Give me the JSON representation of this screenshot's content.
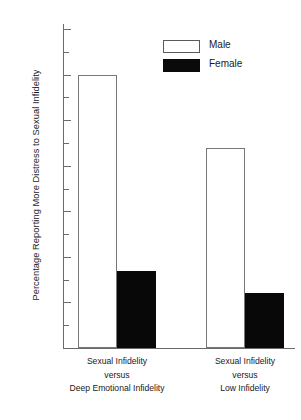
{
  "chart_data": {
    "type": "bar",
    "title": "",
    "xlabel": "",
    "ylabel": "Percentage Reporting More Distress to Sexual Infidelity",
    "ylim": [
      0,
      70
    ],
    "ytick_step_major": 10,
    "ytick_step_minor": 5,
    "grid": false,
    "legend_position": "top-center",
    "categories": [
      "Sexual Infidelity versus Deep Emotional Infidelity",
      "Sexual Infidelity versus Low Infidelity"
    ],
    "category_lines": [
      [
        "Sexual Infidelity",
        "versus",
        "Deep Emotional Infidelity"
      ],
      [
        "Sexual Infidelity",
        "versus",
        "Low Infidelity"
      ]
    ],
    "series": [
      {
        "name": "Male",
        "values": [
          60,
          44
        ],
        "color": "#ffffff",
        "edge_color": "#777777"
      },
      {
        "name": "Female",
        "values": [
          17,
          12
        ],
        "color": "#080808",
        "edge_color": "#080808"
      }
    ],
    "ytick_labels": [
      "0",
      "10",
      "20",
      "30",
      "40",
      "50",
      "60",
      "70"
    ],
    "ytick_values": [
      0,
      10,
      20,
      30,
      40,
      50,
      60,
      70
    ],
    "ytick_minor_values": [
      5,
      15,
      25,
      35,
      45,
      55,
      65
    ]
  },
  "legend": {
    "items": [
      {
        "label": "Male",
        "style": "open"
      },
      {
        "label": "Female",
        "style": "filled"
      }
    ]
  },
  "axis": {
    "y_title": "Percentage Reporting More Distress to Sexual Infidelity"
  },
  "groups": [
    {
      "line1": "Sexual Infidelity",
      "line2": "versus",
      "line3": "Deep Emotional Infidelity"
    },
    {
      "line1": "Sexual Infidelity",
      "line2": "versus",
      "line3": "Low Infidelity"
    }
  ]
}
